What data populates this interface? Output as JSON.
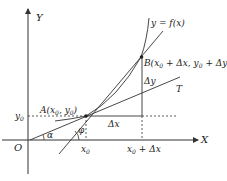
{
  "diagram": {
    "axes": {
      "x_label": "X",
      "y_label": "Y",
      "origin_label": "O"
    },
    "curve_label": "y = f(x)",
    "points": {
      "A": {
        "label": "A(x",
        "sub0": "0",
        "mid": ", y",
        "sub1": "0",
        "end": ")"
      },
      "B": {
        "label": "B(x",
        "sub0": "0",
        "mid": " + Δx, y",
        "sub1": "0",
        "end": " + Δy)"
      }
    },
    "tick_labels": {
      "y0": "y",
      "y0_sub": "0",
      "x0": "x",
      "x0_sub": "0",
      "x0_plus_dx_a": "x",
      "x0_plus_dx_sub": "0",
      "x0_plus_dx_b": " + Δx"
    },
    "increments": {
      "dx": "Δx",
      "dy": "Δy"
    },
    "tangent_label": "T",
    "angles": {
      "alpha": "α",
      "phi": "φ"
    },
    "colors": {
      "stroke": "#333333",
      "text": "#222222",
      "background": "#ffffff"
    }
  }
}
